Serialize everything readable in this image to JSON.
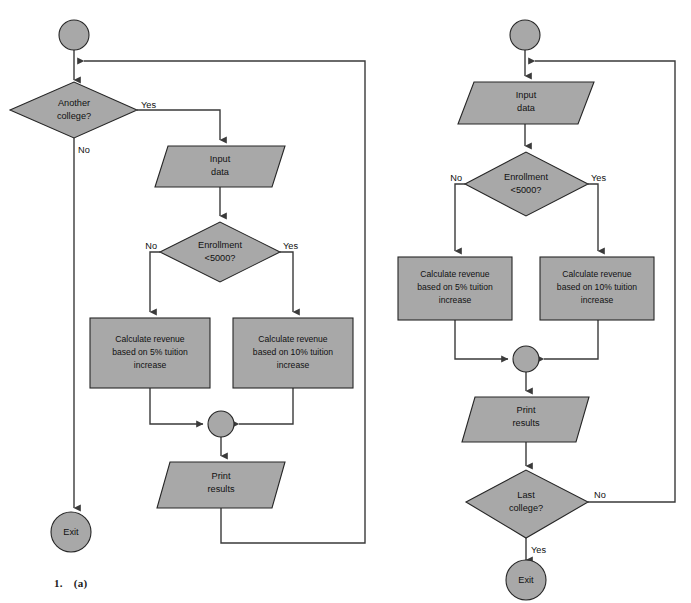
{
  "figure": {
    "caption_number": "1.",
    "caption_label": "(a)",
    "palette": {
      "shape_fill": "#a8a8a8",
      "shape_stroke": "#262626",
      "edge_stroke": "#3a3a3a",
      "background": "#ffffff",
      "text": "#111111"
    }
  },
  "diagrams": [
    {
      "id": "left-flowchart",
      "name": "pretest-loop-flowchart",
      "nodes": [
        {
          "id": "l-start",
          "name": "start-terminator",
          "type": "terminator",
          "label": ""
        },
        {
          "id": "l-dec1",
          "name": "another-college-decision",
          "type": "decision",
          "label_lines": [
            "Another",
            "college?"
          ]
        },
        {
          "id": "l-input",
          "name": "input-data-io",
          "type": "io",
          "label_lines": [
            "Input",
            "data"
          ]
        },
        {
          "id": "l-dec2",
          "name": "enrollment-decision",
          "type": "decision",
          "label_lines": [
            "Enrollment",
            "<5000?"
          ]
        },
        {
          "id": "l-proc1",
          "name": "calculate-revenue-5-percent-process",
          "type": "process",
          "label_lines": [
            "Calculate revenue",
            "based on 5% tuition",
            "increase"
          ]
        },
        {
          "id": "l-proc2",
          "name": "calculate-revenue-10-percent-process",
          "type": "process",
          "label_lines": [
            "Calculate revenue",
            "based on 10% tuition",
            "increase"
          ]
        },
        {
          "id": "l-merge",
          "name": "merge-connector",
          "type": "connector",
          "label": ""
        },
        {
          "id": "l-print",
          "name": "print-results-io",
          "type": "io",
          "label_lines": [
            "Print",
            "results"
          ]
        },
        {
          "id": "l-exit",
          "name": "exit-terminator",
          "type": "terminator",
          "label": "Exit"
        }
      ],
      "edge_labels": {
        "dec1_yes": "Yes",
        "dec1_no": "No",
        "dec2_no": "No",
        "dec2_yes": "Yes"
      }
    },
    {
      "id": "right-flowchart",
      "name": "posttest-loop-flowchart",
      "nodes": [
        {
          "id": "r-start",
          "name": "start-terminator",
          "type": "terminator",
          "label": ""
        },
        {
          "id": "r-input",
          "name": "input-data-io",
          "type": "io",
          "label_lines": [
            "Input",
            "data"
          ]
        },
        {
          "id": "r-dec1",
          "name": "enrollment-decision",
          "type": "decision",
          "label_lines": [
            "Enrollment",
            "<5000?"
          ]
        },
        {
          "id": "r-proc1",
          "name": "calculate-revenue-5-percent-process",
          "type": "process",
          "label_lines": [
            "Calculate revenue",
            "based on 5% tuition",
            "increase"
          ]
        },
        {
          "id": "r-proc2",
          "name": "calculate-revenue-10-percent-process",
          "type": "process",
          "label_lines": [
            "Calculate revenue",
            "based on 10% tuition",
            "increase"
          ]
        },
        {
          "id": "r-merge",
          "name": "merge-connector",
          "type": "connector",
          "label": ""
        },
        {
          "id": "r-print",
          "name": "print-results-io",
          "type": "io",
          "label_lines": [
            "Print",
            "results"
          ]
        },
        {
          "id": "r-dec2",
          "name": "last-college-decision",
          "type": "decision",
          "label_lines": [
            "Last",
            "college?"
          ]
        },
        {
          "id": "r-exit",
          "name": "exit-terminator",
          "type": "terminator",
          "label": "Exit"
        }
      ],
      "edge_labels": {
        "dec1_no": "No",
        "dec1_yes": "Yes",
        "dec2_no": "No",
        "dec2_yes": "Yes"
      }
    }
  ]
}
